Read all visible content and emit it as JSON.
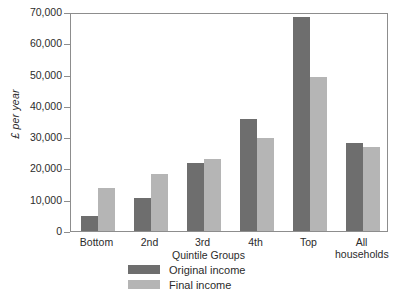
{
  "chart_data": {
    "type": "bar",
    "title": "",
    "xlabel": "Quintile Groups",
    "ylabel": "£ per year",
    "categories": [
      "Bottom",
      "2nd",
      "3rd",
      "4th",
      "Top",
      "All households"
    ],
    "series": [
      {
        "name": "Original income",
        "color": "#6e6e6e",
        "values": [
          4800,
          10700,
          21700,
          35800,
          68400,
          28100
        ]
      },
      {
        "name": "Final income",
        "color": "#b5b5b5",
        "values": [
          13700,
          18200,
          23000,
          29700,
          49200,
          26800
        ]
      }
    ],
    "ylim": [
      0,
      70000
    ],
    "yticks": [
      0,
      10000,
      20000,
      30000,
      40000,
      50000,
      60000,
      70000
    ],
    "ytick_labels": [
      "0",
      "10,000",
      "20,000",
      "30,000",
      "40,000",
      "50,000",
      "60,000",
      "70,000"
    ],
    "grid": false,
    "legend_position": "bottom-left",
    "axis_color": "#8d8d8d"
  },
  "x_labels": [
    {
      "line1": "Bottom",
      "line2": ""
    },
    {
      "line1": "2nd",
      "line2": ""
    },
    {
      "line1": "3rd",
      "line2": ""
    },
    {
      "line1": "4th",
      "line2": ""
    },
    {
      "line1": "Top",
      "line2": ""
    },
    {
      "line1": "All",
      "line2": "households"
    }
  ]
}
